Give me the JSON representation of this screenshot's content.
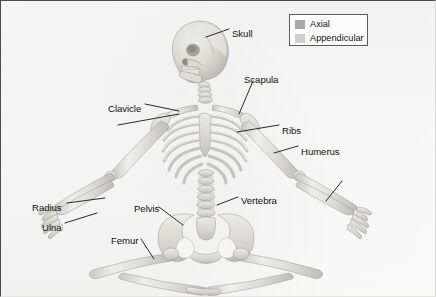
{
  "figure": {
    "background_color": "#fbfbfa",
    "bone_color": "#d9d8d2",
    "leader_color": "#2b2b28"
  },
  "text_blocks": {
    "axial": "The axial skeleton\nis made up of the\nskull, spine, ribs,\nand breastbone. It\nis called the axial\nskeleton because\nit makes up the\ncentral axis, or\nline, of the body.",
    "appendicular": "The\nappendicular\nskeleton is\nmade up of\nall the bones\nthat are not\npart of the\naxial skeleton.\nThese parts\nare sometimes\ncalled\nappendages."
  },
  "legend": {
    "items": [
      {
        "label": "Axial",
        "color": "#a9a9a3"
      },
      {
        "label": "Appendicular",
        "color": "#cfcfc9"
      }
    ]
  },
  "labels": [
    {
      "name": "skull",
      "text": "Skull",
      "x": 231,
      "y": 28
    },
    {
      "name": "scapula",
      "text": "Scapula",
      "x": 243,
      "y": 74
    },
    {
      "name": "clavicle",
      "text": "Clavicle",
      "x": 107,
      "y": 103
    },
    {
      "name": "ribs",
      "text": "Ribs",
      "x": 281,
      "y": 125
    },
    {
      "name": "humerus",
      "text": "Humerus",
      "x": 300,
      "y": 146
    },
    {
      "name": "vertebra",
      "text": "Vertebra",
      "x": 240,
      "y": 195
    },
    {
      "name": "pelvis",
      "text": "Pelvis",
      "x": 133,
      "y": 203
    },
    {
      "name": "radius",
      "text": "Radius",
      "x": 31,
      "y": 202
    },
    {
      "name": "ulna",
      "text": "Ulna",
      "x": 41,
      "y": 222
    },
    {
      "name": "femur",
      "text": "Femur",
      "x": 110,
      "y": 235
    }
  ]
}
